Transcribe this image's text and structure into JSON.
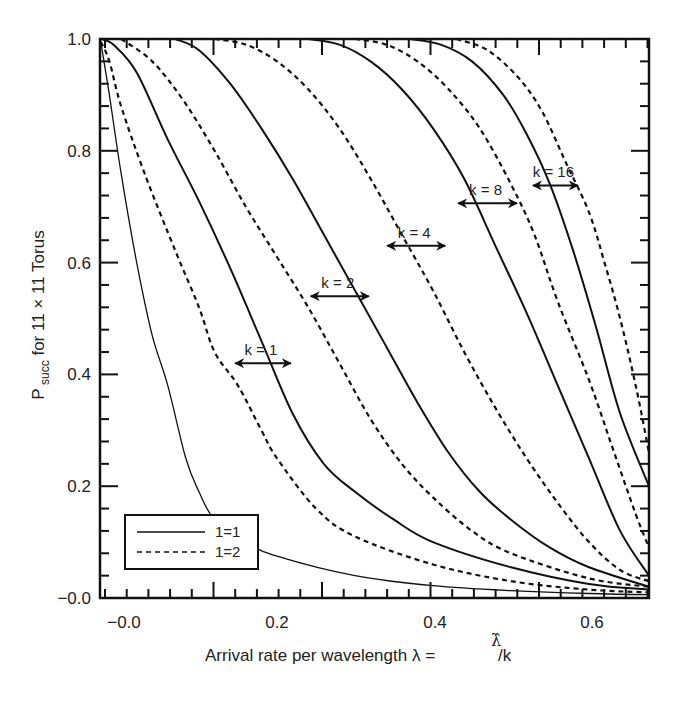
{
  "chart_data": {
    "type": "line",
    "title": "",
    "xlabel": "Arrival rate per wavelength λ = λ̂/k",
    "ylabel": "P_succ for 11 × 11 Torus",
    "xlim": [
      -0.027,
      0.677
    ],
    "ylim": [
      0.0,
      1.0
    ],
    "grid": false,
    "x_tick_labels": [
      "-0.0",
      "0.2",
      "0.4",
      "0.6"
    ],
    "y_tick_labels": [
      "-0.0",
      "0.2",
      "0.4",
      "0.6",
      "0.8",
      "1.0"
    ],
    "legend": {
      "position": "lower left",
      "entries": [
        {
          "label": "1=1",
          "style": "solid"
        },
        {
          "label": "1=2",
          "style": "dashed"
        }
      ]
    },
    "series": [
      {
        "name": "k=1, 1=1",
        "k": 1,
        "style": "solid",
        "width": 1.3,
        "points": [
          [
            -0.026,
            0.995
          ],
          [
            -0.015,
            0.9
          ],
          [
            0.0,
            0.76
          ],
          [
            0.02,
            0.6
          ],
          [
            0.04,
            0.47
          ],
          [
            0.06,
            0.38
          ],
          [
            0.083,
            0.25
          ],
          [
            0.1,
            0.19
          ],
          [
            0.12,
            0.14
          ],
          [
            0.16,
            0.1
          ],
          [
            0.2,
            0.075
          ],
          [
            0.3,
            0.04
          ],
          [
            0.4,
            0.022
          ],
          [
            0.5,
            0.013
          ],
          [
            0.6,
            0.008
          ],
          [
            0.677,
            0.006
          ]
        ]
      },
      {
        "name": "k=1, 1=2",
        "k": 1,
        "style": "dashed",
        "width": 2,
        "points": [
          [
            -0.026,
            0.995
          ],
          [
            -0.015,
            0.96
          ],
          [
            0.0,
            0.88
          ],
          [
            0.03,
            0.76
          ],
          [
            0.07,
            0.62
          ],
          [
            0.1,
            0.52
          ],
          [
            0.12,
            0.44
          ],
          [
            0.15,
            0.38
          ],
          [
            0.18,
            0.3
          ],
          [
            0.2,
            0.25
          ],
          [
            0.25,
            0.16
          ],
          [
            0.3,
            0.11
          ],
          [
            0.4,
            0.06
          ],
          [
            0.5,
            0.03
          ],
          [
            0.6,
            0.015
          ],
          [
            0.677,
            0.01
          ]
        ]
      },
      {
        "name": "k=2, 1=1",
        "k": 2,
        "style": "solid",
        "width": 2,
        "points": [
          [
            -0.026,
            1.0
          ],
          [
            -0.01,
            0.99
          ],
          [
            0.02,
            0.94
          ],
          [
            0.06,
            0.82
          ],
          [
            0.1,
            0.71
          ],
          [
            0.14,
            0.59
          ],
          [
            0.18,
            0.46
          ],
          [
            0.22,
            0.33
          ],
          [
            0.26,
            0.24
          ],
          [
            0.3,
            0.19
          ],
          [
            0.35,
            0.14
          ],
          [
            0.4,
            0.1
          ],
          [
            0.5,
            0.055
          ],
          [
            0.6,
            0.025
          ],
          [
            0.677,
            0.015
          ]
        ]
      },
      {
        "name": "k=2, 1=2",
        "k": 2,
        "style": "dashed",
        "width": 2,
        "points": [
          [
            0.0,
            1.0
          ],
          [
            0.04,
            0.96
          ],
          [
            0.08,
            0.89
          ],
          [
            0.12,
            0.8
          ],
          [
            0.16,
            0.7
          ],
          [
            0.2,
            0.61
          ],
          [
            0.24,
            0.52
          ],
          [
            0.28,
            0.42
          ],
          [
            0.32,
            0.32
          ],
          [
            0.36,
            0.24
          ],
          [
            0.4,
            0.18
          ],
          [
            0.45,
            0.12
          ],
          [
            0.5,
            0.08
          ],
          [
            0.6,
            0.035
          ],
          [
            0.677,
            0.02
          ]
        ]
      },
      {
        "name": "k=4, 1=1",
        "k": 4,
        "style": "solid",
        "width": 2,
        "points": [
          [
            0.07,
            1.0
          ],
          [
            0.1,
            0.98
          ],
          [
            0.14,
            0.92
          ],
          [
            0.18,
            0.84
          ],
          [
            0.22,
            0.75
          ],
          [
            0.26,
            0.65
          ],
          [
            0.3,
            0.55
          ],
          [
            0.34,
            0.45
          ],
          [
            0.38,
            0.35
          ],
          [
            0.42,
            0.26
          ],
          [
            0.46,
            0.19
          ],
          [
            0.5,
            0.14
          ],
          [
            0.55,
            0.09
          ],
          [
            0.6,
            0.055
          ],
          [
            0.677,
            0.02
          ]
        ]
      },
      {
        "name": "k=4, 1=2",
        "k": 4,
        "style": "dashed",
        "width": 2,
        "points": [
          [
            0.12,
            1.0
          ],
          [
            0.16,
            0.99
          ],
          [
            0.2,
            0.96
          ],
          [
            0.24,
            0.91
          ],
          [
            0.28,
            0.84
          ],
          [
            0.32,
            0.75
          ],
          [
            0.36,
            0.65
          ],
          [
            0.4,
            0.55
          ],
          [
            0.44,
            0.44
          ],
          [
            0.48,
            0.34
          ],
          [
            0.52,
            0.25
          ],
          [
            0.56,
            0.17
          ],
          [
            0.6,
            0.1
          ],
          [
            0.64,
            0.05
          ],
          [
            0.677,
            0.03
          ]
        ]
      },
      {
        "name": "k=8, 1=1",
        "k": 8,
        "style": "solid",
        "width": 2,
        "points": [
          [
            0.24,
            1.0
          ],
          [
            0.28,
            0.99
          ],
          [
            0.32,
            0.96
          ],
          [
            0.36,
            0.91
          ],
          [
            0.4,
            0.84
          ],
          [
            0.44,
            0.75
          ],
          [
            0.48,
            0.63
          ],
          [
            0.52,
            0.51
          ],
          [
            0.56,
            0.38
          ],
          [
            0.6,
            0.25
          ],
          [
            0.64,
            0.12
          ],
          [
            0.677,
            0.04
          ]
        ]
      },
      {
        "name": "k=8, 1=2",
        "k": 8,
        "style": "dashed",
        "width": 2,
        "points": [
          [
            0.3,
            1.0
          ],
          [
            0.34,
            0.99
          ],
          [
            0.38,
            0.96
          ],
          [
            0.42,
            0.91
          ],
          [
            0.46,
            0.84
          ],
          [
            0.5,
            0.74
          ],
          [
            0.53,
            0.65
          ],
          [
            0.56,
            0.53
          ],
          [
            0.6,
            0.39
          ],
          [
            0.63,
            0.27
          ],
          [
            0.66,
            0.15
          ],
          [
            0.677,
            0.09
          ]
        ]
      },
      {
        "name": "k=16, 1=1",
        "k": 16,
        "style": "solid",
        "width": 2,
        "points": [
          [
            0.37,
            1.0
          ],
          [
            0.41,
            0.99
          ],
          [
            0.45,
            0.96
          ],
          [
            0.49,
            0.9
          ],
          [
            0.52,
            0.83
          ],
          [
            0.55,
            0.74
          ],
          [
            0.58,
            0.62
          ],
          [
            0.61,
            0.48
          ],
          [
            0.64,
            0.33
          ],
          [
            0.677,
            0.2
          ]
        ]
      },
      {
        "name": "k=16, 1=2",
        "k": 16,
        "style": "dashed",
        "width": 2,
        "points": [
          [
            0.43,
            1.0
          ],
          [
            0.47,
            0.98
          ],
          [
            0.51,
            0.93
          ],
          [
            0.54,
            0.87
          ],
          [
            0.57,
            0.78
          ],
          [
            0.6,
            0.69
          ],
          [
            0.62,
            0.6
          ],
          [
            0.64,
            0.5
          ],
          [
            0.66,
            0.38
          ],
          [
            0.677,
            0.26
          ]
        ]
      }
    ],
    "annotations": [
      {
        "text": "k = 1",
        "arrow_x": [
          0.145,
          0.219
        ],
        "y": 0.42
      },
      {
        "text": "k = 2",
        "arrow_x": [
          0.242,
          0.319
        ],
        "y": 0.54
      },
      {
        "text": "k = 4",
        "arrow_x": [
          0.34,
          0.417
        ],
        "y": 0.63
      },
      {
        "text": "k = 8",
        "arrow_x": [
          0.431,
          0.509
        ],
        "y": 0.706
      },
      {
        "text": "k = 16",
        "arrow_x": [
          0.527,
          0.587
        ],
        "y": 0.738
      }
    ]
  },
  "colors": {
    "line": "#111111",
    "text": "#222222",
    "background": "#ffffff"
  }
}
